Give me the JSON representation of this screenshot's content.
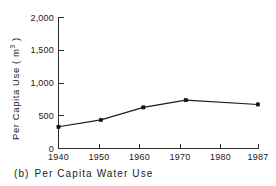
{
  "chart_data": {
    "type": "line",
    "title": "",
    "caption_tag": "(b)",
    "caption_text": "Per Capita Water Use",
    "xlabel": "",
    "ylabel": "Per Capita Use ( m",
    "ylabel_superscript": "3",
    "ylabel_suffix": " )",
    "x": [
      1940,
      1950,
      1960,
      1970,
      1987
    ],
    "values": [
      330,
      435,
      625,
      735,
      670
    ],
    "series": [
      {
        "name": "Per Capita Water Use",
        "values": [
          330,
          435,
          625,
          735,
          670
        ]
      }
    ],
    "xtick_values": [
      1940,
      1950,
      1960,
      1970,
      1980,
      1987
    ],
    "xtick_labels": [
      "1940",
      "1950",
      "1960",
      "1970",
      "1980",
      "1987"
    ],
    "ytick_values": [
      0,
      500,
      1000,
      1500,
      2000
    ],
    "ytick_labels": [
      "0",
      "500",
      "1,000",
      "1,500",
      "2,000"
    ],
    "xlim": [
      1940,
      1987
    ],
    "ylim": [
      0,
      2000
    ],
    "grid": false,
    "legend": false,
    "marker": "filled-square",
    "line_color": "#1a1a1a",
    "marker_color": "#111111",
    "axis_color": "#2b2b2b",
    "background": "#ffffff"
  }
}
